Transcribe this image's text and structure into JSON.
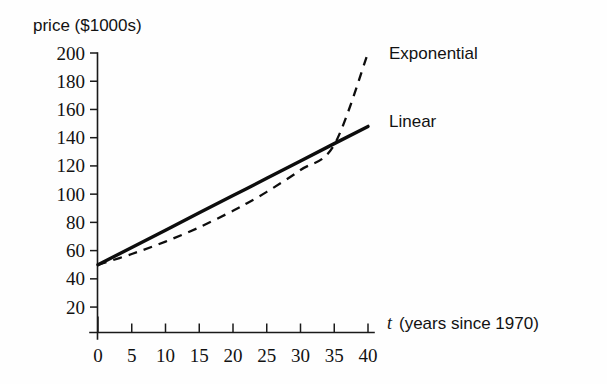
{
  "chart_data": {
    "type": "line",
    "title": "",
    "xlabel": "t (years since 1970)",
    "xlabel_symbol": "t",
    "xlabel_rest": "(years since 1970)",
    "ylabel": "price ($1000s)",
    "xlim": [
      0,
      40
    ],
    "ylim": [
      0,
      200
    ],
    "grid": false,
    "legend_position": "inline-right",
    "xticks": [
      0,
      5,
      10,
      15,
      20,
      25,
      30,
      35,
      40
    ],
    "xtick_labels": [
      "0",
      "5",
      "10",
      "15",
      "20",
      "25",
      "30",
      "35",
      "40"
    ],
    "yticks": [
      20,
      40,
      60,
      80,
      100,
      120,
      140,
      160,
      180,
      200
    ],
    "ytick_labels": [
      "20",
      "40",
      "60",
      "80",
      "100",
      "120",
      "140",
      "160",
      "180",
      "200"
    ],
    "x": [
      0,
      5,
      10,
      15,
      20,
      22,
      25,
      30,
      35,
      40
    ],
    "series": [
      {
        "name": "Linear",
        "style": "solid",
        "color": "#0d0d0d",
        "label": "Linear",
        "values": [
          50,
          62.2,
          74.5,
          86.8,
          99.0,
          103.9,
          111.2,
          123.5,
          135.8,
          148.0
        ]
      },
      {
        "name": "Exponential",
        "style": "dashed",
        "color": "#0d0d0d",
        "label": "Exponential",
        "values": [
          50,
          57.6,
          66.4,
          76.5,
          88.2,
          93.4,
          101.6,
          117.1,
          135.0,
          200.0
        ]
      }
    ],
    "annotations": [
      {
        "text": "Exponential",
        "x": 41.5,
        "y": 197
      },
      {
        "text": "Linear",
        "x": 41.5,
        "y": 145
      }
    ]
  },
  "colors": {
    "background": "#fefefe",
    "ink": "#121212",
    "axis": "#1a1a1a"
  }
}
